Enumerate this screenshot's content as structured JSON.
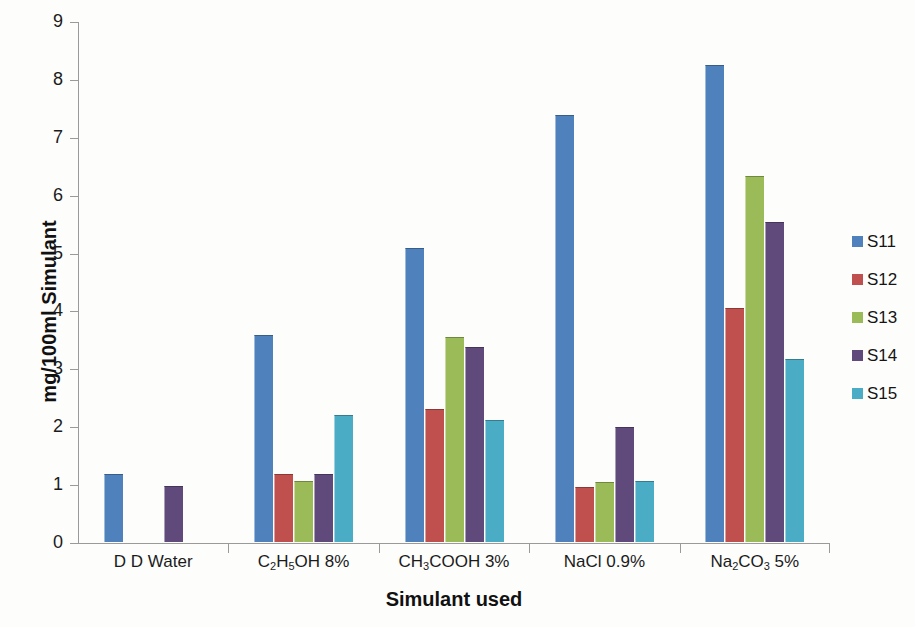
{
  "chart_data": {
    "type": "bar",
    "title": "",
    "xlabel": "Simulant used",
    "ylabel": "mg/100ml Simulant",
    "categories": [
      "D D Water",
      "C2H5OH 8%",
      "CH3COOH 3%",
      "NaCl 0.9%",
      "Na2CO3 5%"
    ],
    "categories_display": [
      {
        "parts": [
          {
            "t": "D D Water",
            "sub": false
          }
        ]
      },
      {
        "parts": [
          {
            "t": "C",
            "sub": false
          },
          {
            "t": "2",
            "sub": true
          },
          {
            "t": "H",
            "sub": false
          },
          {
            "t": "5",
            "sub": true
          },
          {
            "t": "OH 8%",
            "sub": false
          }
        ]
      },
      {
        "parts": [
          {
            "t": "CH",
            "sub": false
          },
          {
            "t": "3",
            "sub": true
          },
          {
            "t": "COOH 3%",
            "sub": false
          }
        ]
      },
      {
        "parts": [
          {
            "t": "NaCl 0.9%",
            "sub": false
          }
        ]
      },
      {
        "parts": [
          {
            "t": "Na",
            "sub": false
          },
          {
            "t": "2",
            "sub": true
          },
          {
            "t": "CO",
            "sub": false
          },
          {
            "t": "3",
            "sub": true
          },
          {
            "t": " 5%",
            "sub": false
          }
        ]
      }
    ],
    "series": [
      {
        "name": "S11",
        "color": "#4f81bd",
        "values": [
          1.18,
          3.58,
          5.08,
          7.37,
          8.24
        ]
      },
      {
        "name": "S12",
        "color": "#c0504d",
        "values": [
          0,
          1.17,
          2.29,
          0.95,
          4.04
        ]
      },
      {
        "name": "S13",
        "color": "#9bbb59",
        "values": [
          0,
          1.06,
          3.55,
          1.03,
          6.32
        ]
      },
      {
        "name": "S14",
        "color": "#604a7b",
        "values": [
          0.97,
          1.17,
          3.37,
          1.98,
          5.53
        ]
      },
      {
        "name": "S15",
        "color": "#4bacc6",
        "values": [
          0,
          2.2,
          2.1,
          1.05,
          3.16
        ]
      }
    ],
    "ylim": [
      0,
      9
    ],
    "ytick_labels": [
      "0",
      "1",
      "2",
      "3",
      "4",
      "5",
      "6",
      "7",
      "8",
      "9"
    ],
    "ytick_values": [
      0,
      1,
      2,
      3,
      4,
      5,
      6,
      7,
      8,
      9
    ],
    "grid": false,
    "legend_position": "right",
    "legend_entries": [
      {
        "label": "S11",
        "color": "#4f81bd"
      },
      {
        "label": "S12",
        "color": "#c0504d"
      },
      {
        "label": "S13",
        "color": "#9bbb59"
      },
      {
        "label": "S14",
        "color": "#604a7b"
      },
      {
        "label": "S15",
        "color": "#4bacc6"
      }
    ]
  }
}
